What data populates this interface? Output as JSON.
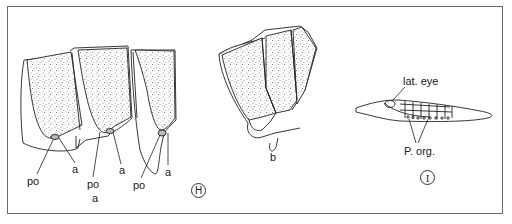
{
  "figure": {
    "panels": [
      {
        "id": "H",
        "label": "H",
        "annotations": [
          {
            "text": "po",
            "role": "label-po-1"
          },
          {
            "text": "a",
            "role": "label-a-1"
          },
          {
            "text": "po",
            "role": "label-po-2"
          },
          {
            "text": "a",
            "role": "label-a-2"
          },
          {
            "text": "po",
            "role": "label-po-3"
          },
          {
            "text": "a",
            "role": "label-a-3"
          },
          {
            "text": "a",
            "role": "sublabel-a"
          },
          {
            "text": "b",
            "role": "sublabel-b"
          }
        ]
      },
      {
        "id": "I",
        "label": "I",
        "annotations": [
          {
            "text": "lat. eye",
            "role": "label-lat-eye"
          },
          {
            "text": "P. org.",
            "role": "label-p-org"
          }
        ]
      }
    ]
  },
  "colors": {
    "ink": "#1a1a1a",
    "stipple": "#8a8a8a",
    "frame": "#6a6a6a"
  }
}
